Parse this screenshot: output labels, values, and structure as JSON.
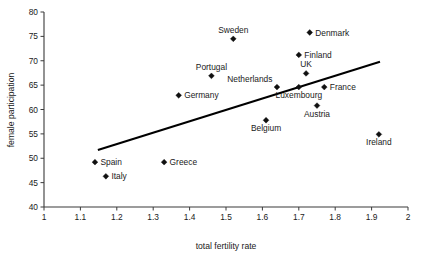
{
  "chart_data": {
    "type": "scatter",
    "title": "",
    "xlabel": "total fertility rate",
    "ylabel": "female participation",
    "xlim": [
      1,
      2
    ],
    "ylim": [
      40,
      80
    ],
    "xticks": [
      "1",
      "1.1",
      "1.2",
      "1.3",
      "1.4",
      "1.5",
      "1.6",
      "1.7",
      "1.8",
      "1.9",
      "2"
    ],
    "xtick_values": [
      1,
      1.1,
      1.2,
      1.3,
      1.4,
      1.5,
      1.6,
      1.7,
      1.8,
      1.9,
      2
    ],
    "yticks": [
      "40",
      "45",
      "50",
      "55",
      "60",
      "65",
      "70",
      "75",
      "80"
    ],
    "ytick_values": [
      40,
      45,
      50,
      55,
      60,
      65,
      70,
      75,
      80
    ],
    "grid": false,
    "legend": "none",
    "marker": "diamond",
    "marker_color": "#101010",
    "trendline": {
      "visible": true,
      "color": "#000000",
      "x_start": 1.148,
      "y_start": 51.7,
      "x_end": 1.923,
      "y_end": 69.8
    },
    "points": [
      {
        "label": "Spain",
        "x": 1.14,
        "y": 49.2,
        "label_pos": "right"
      },
      {
        "label": "Italy",
        "x": 1.17,
        "y": 46.3,
        "label_pos": "right"
      },
      {
        "label": "Greece",
        "x": 1.33,
        "y": 49.2,
        "label_pos": "right"
      },
      {
        "label": "Germany",
        "x": 1.37,
        "y": 62.9,
        "label_pos": "right"
      },
      {
        "label": "Portugal",
        "x": 1.46,
        "y": 66.9,
        "label_pos": "above"
      },
      {
        "label": "Sweden",
        "x": 1.52,
        "y": 74.5,
        "label_pos": "above"
      },
      {
        "label": "Belgium",
        "x": 1.61,
        "y": 57.8,
        "label_pos": "below"
      },
      {
        "label": "Netherlands",
        "x": 1.64,
        "y": 64.6,
        "label_pos": "above-left"
      },
      {
        "label": "Finland",
        "x": 1.7,
        "y": 71.2,
        "label_pos": "right"
      },
      {
        "label": "Luxembourg",
        "x": 1.7,
        "y": 64.6,
        "label_pos": "below"
      },
      {
        "label": "UK",
        "x": 1.72,
        "y": 67.4,
        "label_pos": "above"
      },
      {
        "label": "Denmark",
        "x": 1.73,
        "y": 75.8,
        "label_pos": "right"
      },
      {
        "label": "Austria",
        "x": 1.75,
        "y": 60.8,
        "label_pos": "below"
      },
      {
        "label": "France",
        "x": 1.77,
        "y": 64.6,
        "label_pos": "right"
      },
      {
        "label": "Ireland",
        "x": 1.92,
        "y": 54.9,
        "label_pos": "below"
      }
    ]
  }
}
